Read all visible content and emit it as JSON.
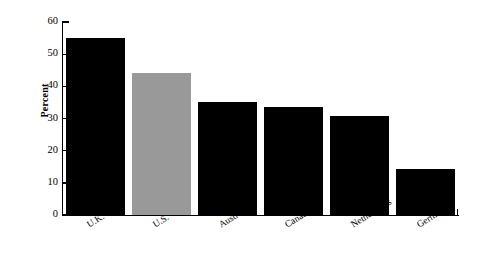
{
  "chart_data": {
    "type": "bar",
    "title": "",
    "xlabel": "",
    "ylabel": "Percent",
    "categories": [
      "U.K.",
      "U.S.",
      "Australia",
      "Canada",
      "Netherlands",
      "Germany"
    ],
    "values": [
      55,
      44,
      35,
      33.5,
      30.7,
      14.3
    ],
    "ylim": [
      0,
      60
    ],
    "yticks": [
      0,
      10,
      20,
      30,
      40,
      50,
      60
    ],
    "ytick_labels": [
      "0",
      "10",
      "20",
      "30",
      "40",
      "50",
      "60"
    ],
    "grid": false,
    "legend": null,
    "bar_colors": [
      "#000000",
      "#999999",
      "#000000",
      "#000000",
      "#000000",
      "#000000"
    ],
    "highlight_color": "#999999",
    "default_color": "#000000",
    "axis_color": "#000000"
  }
}
